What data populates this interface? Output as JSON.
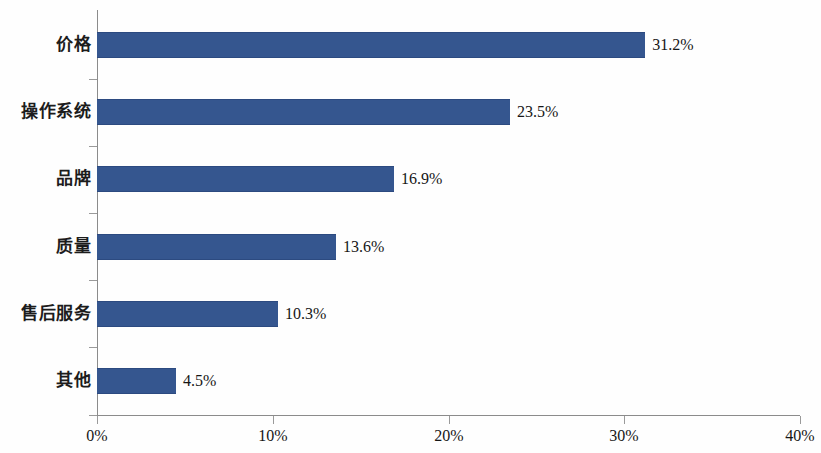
{
  "chart_data": {
    "type": "bar",
    "orientation": "horizontal",
    "title": "",
    "subtitle": "",
    "xlabel": "",
    "ylabel": "",
    "categories": [
      "价格",
      "操作系统",
      "品牌",
      "质量",
      "售后服务",
      "其他"
    ],
    "values": [
      31.2,
      23.5,
      16.9,
      13.6,
      10.3,
      4.5
    ],
    "value_labels": [
      "31.2%",
      "23.5%",
      "16.9%",
      "13.6%",
      "10.3%",
      "4.5%"
    ],
    "xlim": [
      0,
      40
    ],
    "xticks": [
      0,
      10,
      20,
      30,
      40
    ],
    "xtick_labels": [
      "0%",
      "10%",
      "20%",
      "30%",
      "40%"
    ],
    "grid": false,
    "legend": false,
    "series": [
      {
        "name": "",
        "values": [
          31.2,
          23.5,
          16.9,
          13.6,
          10.3,
          4.5
        ]
      }
    ],
    "colors": {
      "bar": "#35568F",
      "bar_edge": "#2C4A80",
      "axis": "#8B8B8B",
      "text": "#161616",
      "background": "#FEFEFE"
    }
  }
}
